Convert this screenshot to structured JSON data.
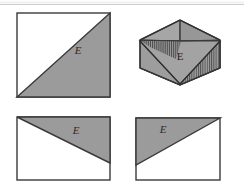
{
  "figure": {
    "background_color": "#ffffff",
    "rule_color": "#cfcfcf",
    "outline_color": "#3a3a3a",
    "shade_fill": "#9b9b9b",
    "shade_fill_light": "#a7a7a7",
    "shade_fill_dark": "#8e8e8e",
    "hatch_color": "#4a4a4a",
    "label_color": "#2b2b2b",
    "top_rule": {
      "name": "top-divider-rule",
      "y": 4,
      "x1": 0,
      "x2": 244
    },
    "panels": [
      {
        "id": "panel-top-left",
        "name": "square-with-lower-right-shaded-triangle",
        "label": "E",
        "label_x": 78,
        "label_y": 54,
        "rect": {
          "x": 17,
          "y": 13,
          "w": 93,
          "h": 84
        },
        "shaded_triangle": "bottom-left to top-right diagonal, lower-right half shaded",
        "diagonal": {
          "x1": 17,
          "y1": 97,
          "x2": 110,
          "y2": 13
        }
      },
      {
        "id": "panel-top-right",
        "name": "isometric-box-with-hatched-faces",
        "label": "E",
        "label_x": 180,
        "label_y": 58,
        "outline": "hexagonal isometric solid",
        "faces": [
          {
            "name": "top-left-face",
            "fill": "#a2a2a2",
            "hatched": false
          },
          {
            "name": "top-right-face",
            "fill": "#9a9a9a",
            "hatched": false
          },
          {
            "name": "left-face-hatched",
            "fill": "#9e9e9e",
            "hatched": true
          },
          {
            "name": "center-triangle-face",
            "fill": "#a5a5a5",
            "hatched": false
          },
          {
            "name": "right-face-hatched",
            "fill": "#989898",
            "hatched": true
          },
          {
            "name": "bottom-front-face",
            "fill": "#9c9c9c",
            "hatched": false
          }
        ]
      },
      {
        "id": "panel-bottom-left",
        "name": "rectangle-with-upper-shaded-triangle-descending",
        "label": "E",
        "label_x": 76,
        "label_y": 133,
        "rect": {
          "x": 17,
          "y": 117,
          "w": 93,
          "h": 63
        },
        "shaded_triangle": "top edge plus diagonal from top-left down to right edge",
        "diagonal": {
          "x1": 17,
          "y1": 117,
          "x2": 110,
          "y2": 163
        }
      },
      {
        "id": "panel-bottom-right",
        "name": "rectangle-with-upper-shaded-triangle-ascending",
        "label": "E",
        "label_x": 163,
        "label_y": 132,
        "rect": {
          "x": 136,
          "y": 118,
          "w": 84,
          "h": 62
        },
        "shaded_triangle": "top edge plus diagonal from left edge up to top-right corner",
        "diagonal": {
          "x1": 136,
          "y1": 165,
          "x2": 220,
          "y2": 118
        }
      }
    ]
  }
}
